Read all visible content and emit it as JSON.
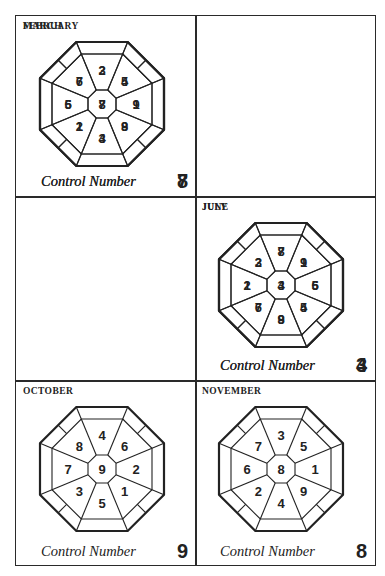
{
  "caption_label": "Control Number",
  "charts": [
    {
      "month": "FEBRUARY",
      "control": "8",
      "center": "8",
      "n": "3",
      "ne": "5",
      "e": "1",
      "se": "9",
      "s": "4",
      "sw": "2",
      "w": "6",
      "nw": "7"
    },
    {
      "month": "MARCH",
      "control": "7",
      "center": "7",
      "n": "2",
      "ne": "4",
      "e": "9",
      "se": "8",
      "s": "3",
      "sw": "1",
      "w": "5",
      "nw": "6"
    },
    {
      "month": "JUNE",
      "control": "4",
      "center": "4",
      "n": "8",
      "ne": "1",
      "e": "6",
      "se": "5",
      "s": "9",
      "sw": "7",
      "w": "2",
      "nw": "3"
    },
    {
      "month": "JULY",
      "control": "3",
      "center": "3",
      "n": "7",
      "ne": "9",
      "e": "5",
      "se": "4",
      "s": "8",
      "sw": "6",
      "w": "1",
      "nw": "2"
    },
    {
      "month": "OCTOBER",
      "control": "9",
      "center": "9",
      "n": "4",
      "ne": "6",
      "e": "2",
      "se": "1",
      "s": "5",
      "sw": "3",
      "w": "7",
      "nw": "8"
    },
    {
      "month": "NOVEMBER",
      "control": "8",
      "center": "8",
      "n": "3",
      "ne": "5",
      "e": "1",
      "se": "9",
      "s": "4",
      "sw": "2",
      "w": "6",
      "nw": "7"
    }
  ]
}
